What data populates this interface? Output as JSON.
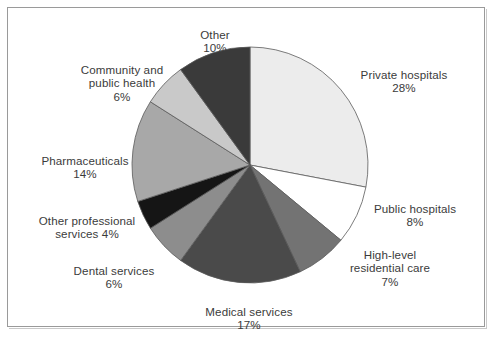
{
  "figure": {
    "frame_border_color": "#9a9a9a",
    "background": "#ffffff",
    "text_color": "#3b3b3b"
  },
  "chart_data": {
    "type": "pie",
    "title": "",
    "subtitle": "",
    "xlabel": "",
    "ylabel": "",
    "legend_position": "none",
    "grid": false,
    "units": "percent",
    "start_angle_deg": 0,
    "direction": "clockwise",
    "center": {
      "x": 250,
      "y": 165
    },
    "radius": 118,
    "categories": [
      "Private hospitals",
      "Public hospitals",
      "High-level residential care",
      "Medical services",
      "Dental services",
      "Other professional services",
      "Pharmaceuticals",
      "Community and public health",
      "Other"
    ],
    "values": [
      28,
      8,
      7,
      17,
      6,
      4,
      14,
      6,
      10
    ],
    "colors": [
      "#ececec",
      "#ffffff",
      "#737373",
      "#4a4a4a",
      "#8d8d8d",
      "#151515",
      "#a8a8a8",
      "#c9c9c9",
      "#3a3a3a"
    ],
    "slice_border_color": "#5a5a5a",
    "slices": [
      {
        "label": "Private hospitals",
        "value": 28,
        "value_text": "28%",
        "color": "#ececec"
      },
      {
        "label": "Public hospitals",
        "value": 8,
        "value_text": "8%",
        "color": "#ffffff"
      },
      {
        "label": "High-level residential care",
        "value": 7,
        "value_text": "7%",
        "color": "#737373"
      },
      {
        "label": "Medical services",
        "value": 17,
        "value_text": "17%",
        "color": "#4a4a4a"
      },
      {
        "label": "Dental services",
        "value": 6,
        "value_text": "6%",
        "color": "#8d8d8d"
      },
      {
        "label": "Other professional services",
        "value": 4,
        "value_text": "4%",
        "color": "#151515"
      },
      {
        "label": "Pharmaceuticals",
        "value": 14,
        "value_text": "14%",
        "color": "#a8a8a8"
      },
      {
        "label": "Community and public health",
        "value": 6,
        "value_text": "6%",
        "color": "#c9c9c9"
      },
      {
        "label": "Other",
        "value": 10,
        "value_text": "10%",
        "color": "#3a3a3a"
      }
    ]
  },
  "labels": {
    "other": {
      "name": "Other",
      "pct": "10%"
    },
    "community": {
      "name": "Community and\npublic health",
      "pct": "6%"
    },
    "pharmaceuticals": {
      "name": "Pharmaceuticals",
      "pct": "14%"
    },
    "other_prof": {
      "name": "Other professional\nservices 4%",
      "pct": ""
    },
    "dental": {
      "name": "Dental services",
      "pct": "6%"
    },
    "medical": {
      "name": "Medical services",
      "pct": "17%"
    },
    "high_level": {
      "name": "High-level\nresidential care",
      "pct": "7%"
    },
    "public_hosp": {
      "name": "Public hospitals",
      "pct": "8%"
    },
    "private_hosp": {
      "name": "Private hospitals",
      "pct": "28%"
    }
  }
}
